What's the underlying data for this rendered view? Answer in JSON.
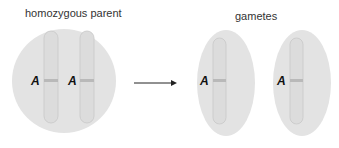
{
  "titles": {
    "parent": "homozygous parent",
    "gametes": "gametes"
  },
  "parent_cell": {
    "chromosomes": [
      {
        "allele": "A"
      },
      {
        "allele": "A"
      }
    ]
  },
  "gametes": [
    {
      "allele": "A"
    },
    {
      "allele": "A"
    }
  ],
  "colors": {
    "cell_fill": "#e3e3e3",
    "chromosome_fill": "#dcdcdc",
    "chromosome_stroke": "#c4c4c4",
    "band": "#b9b9b9",
    "arrow": "#222222"
  }
}
